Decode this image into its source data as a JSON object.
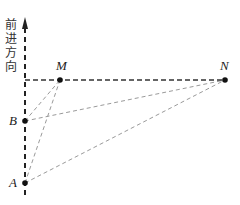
{
  "axis_label": [
    "前",
    "进",
    "方",
    "向"
  ],
  "points": {
    "M": {
      "label": "M",
      "x": 60,
      "y": 80
    },
    "N": {
      "label": "N",
      "x": 225,
      "y": 80
    },
    "B": {
      "label": "B",
      "x": 25,
      "y": 121
    },
    "A": {
      "label": "A",
      "x": 25,
      "y": 183
    }
  },
  "segments": [
    "A-M",
    "B-M",
    "A-N",
    "B-N",
    "M-N"
  ],
  "colors": {
    "axis": "#222222",
    "guide": "#999999",
    "point": "#111111"
  }
}
